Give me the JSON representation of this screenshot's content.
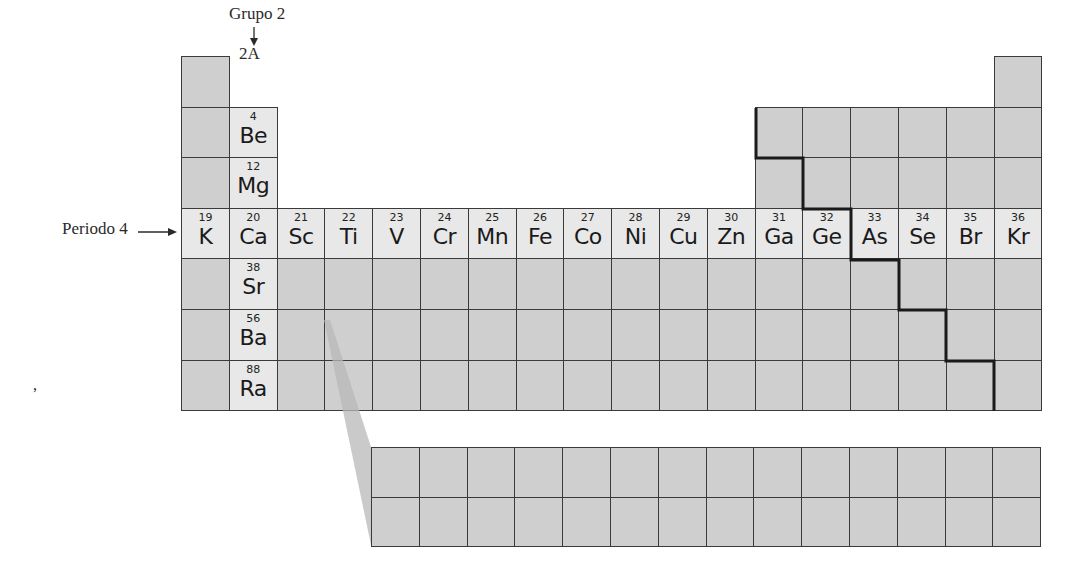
{
  "labels": {
    "group": "Grupo 2",
    "group_subtitle": "2A",
    "period": "Periodo 4",
    "stray_mark": ","
  },
  "colors": {
    "cell_dark": "#cfcfcf",
    "cell_light": "#e8e8e8",
    "grid_line": "#3a3a3a",
    "staircase": "#1a1a1a"
  },
  "group2_elements": [
    {
      "number": "4",
      "symbol": "Be",
      "row": 2
    },
    {
      "number": "12",
      "symbol": "Mg",
      "row": 3
    },
    {
      "number": "20",
      "symbol": "Ca",
      "row": 4
    },
    {
      "number": "38",
      "symbol": "Sr",
      "row": 5
    },
    {
      "number": "56",
      "symbol": "Ba",
      "row": 6
    },
    {
      "number": "88",
      "symbol": "Ra",
      "row": 7
    }
  ],
  "period4_elements": [
    {
      "number": "19",
      "symbol": "K"
    },
    {
      "number": "20",
      "symbol": "Ca"
    },
    {
      "number": "21",
      "symbol": "Sc"
    },
    {
      "number": "22",
      "symbol": "Ti"
    },
    {
      "number": "23",
      "symbol": "V"
    },
    {
      "number": "24",
      "symbol": "Cr"
    },
    {
      "number": "25",
      "symbol": "Mn"
    },
    {
      "number": "26",
      "symbol": "Fe"
    },
    {
      "number": "27",
      "symbol": "Co"
    },
    {
      "number": "28",
      "symbol": "Ni"
    },
    {
      "number": "29",
      "symbol": "Cu"
    },
    {
      "number": "30",
      "symbol": "Zn"
    },
    {
      "number": "31",
      "symbol": "Ga"
    },
    {
      "number": "32",
      "symbol": "Ge"
    },
    {
      "number": "33",
      "symbol": "As"
    },
    {
      "number": "34",
      "symbol": "Se"
    },
    {
      "number": "35",
      "symbol": "Br"
    },
    {
      "number": "36",
      "symbol": "Kr"
    }
  ]
}
